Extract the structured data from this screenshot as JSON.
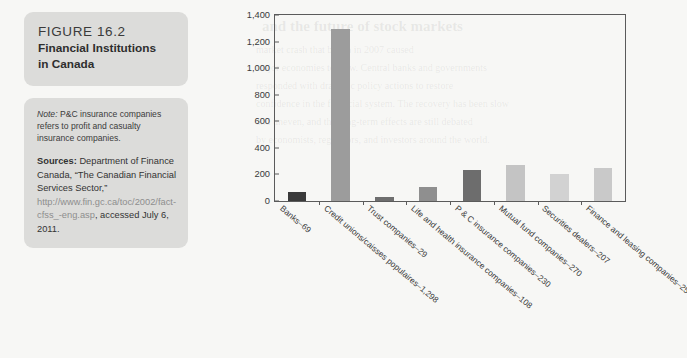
{
  "figure": {
    "number": "FIGURE 16.2",
    "title_line1": "Financial Institutions",
    "title_line2": "in Canada"
  },
  "note": {
    "label": "Note:",
    "text": " P&C insurance companies refers to profit and casualty insurance companies."
  },
  "sources": {
    "label": "Sources:",
    "text_before": " Department of Finance Canada, “The Canadian Financial Services Sector,” ",
    "url": "http://www.fin.gc.ca/toc/2002/fact-cfss_-eng.asp",
    "text_after": ", accessed July 6, 2011."
  },
  "chart_data": {
    "type": "bar",
    "title": "",
    "xlabel": "",
    "ylabel": "",
    "ylim": [
      0,
      1400
    ],
    "ytick_labels": [
      "0",
      "200",
      "400",
      "600",
      "800",
      "1,000",
      "1,200",
      "1,400"
    ],
    "ytick_values": [
      0,
      200,
      400,
      600,
      800,
      1000,
      1200,
      1400
    ],
    "grid": false,
    "legend": "none",
    "categories": [
      "Banks–69",
      "Credit unions/caisses populaires–1,298",
      "Trust companies–29",
      "Life and health insurance companies–108",
      "P & C insurance companies–230",
      "Mutual fund companies–270",
      "Securities dealers–207",
      "Finance and leasing companies–250"
    ],
    "values": [
      69,
      1298,
      29,
      108,
      230,
      270,
      207,
      250
    ],
    "bar_colors": [
      "#3a3a3a",
      "#9c9c9c",
      "#6e6e6e",
      "#8f8f8f",
      "#6d6d6d",
      "#c4c4c4",
      "#d2d2d2",
      "#c9c9c9"
    ]
  },
  "colors": {
    "caption_box": "#dcdcda",
    "axis": "#5b5b5b",
    "page_background": "#f7f7f5"
  },
  "ghost_text": {
    "line1": "and the future of stock markets",
    "line2": "market crash that began in 2007 caused",
    "line3": "major economies to slow. Central banks and governments",
    "line4": "responded with dramatic policy actions to restore",
    "line5": "confidence in the financial system. The recovery has been slow",
    "line6": "and uneven, and the long-term effects are still debated",
    "line7": "by economists, regulators, and investors around the world."
  }
}
